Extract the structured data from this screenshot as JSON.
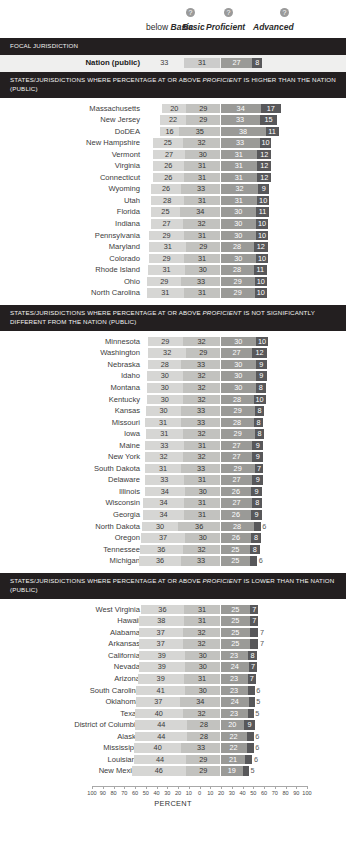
{
  "header": {
    "categories": [
      {
        "prefix": "below ",
        "label": "Basic",
        "help": false,
        "icon": "help-icon"
      },
      {
        "prefix": "",
        "label": "Basic",
        "help": true,
        "icon": "help-icon"
      },
      {
        "prefix": "",
        "label": "Proficient",
        "help": true,
        "icon": "help-icon"
      },
      {
        "prefix": "",
        "label": "Advanced",
        "help": true,
        "icon": "help-icon"
      }
    ],
    "help_glyph": "?"
  },
  "sections": [
    {
      "title": "FOCAL JURISDICTION",
      "rows": [
        {
          "name": "Nation (public)",
          "below_basic": 33,
          "basic": 31,
          "proficient": 27,
          "advanced": 8
        }
      ]
    },
    {
      "title": "STATES/JURISDICTIONS WHERE PERCENTAGE AT OR ABOVE PROFICIENT IS HIGHER THAN THE NATION (PUBLIC)",
      "title_italic_word": "PROFICIENT",
      "rows": [
        {
          "name": "Massachusetts",
          "below_basic": 20,
          "basic": 29,
          "proficient": 34,
          "advanced": 17
        },
        {
          "name": "New Jersey",
          "below_basic": 22,
          "basic": 29,
          "proficient": 33,
          "advanced": 15
        },
        {
          "name": "DoDEA",
          "below_basic": 16,
          "basic": 35,
          "proficient": 38,
          "advanced": 11
        },
        {
          "name": "New Hampshire",
          "below_basic": 25,
          "basic": 32,
          "proficient": 33,
          "advanced": 10
        },
        {
          "name": "Vermont",
          "below_basic": 27,
          "basic": 30,
          "proficient": 31,
          "advanced": 12
        },
        {
          "name": "Virginia",
          "below_basic": 26,
          "basic": 31,
          "proficient": 31,
          "advanced": 12
        },
        {
          "name": "Connecticut",
          "below_basic": 26,
          "basic": 31,
          "proficient": 31,
          "advanced": 12
        },
        {
          "name": "Wyoming",
          "below_basic": 26,
          "basic": 33,
          "proficient": 32,
          "advanced": 9
        },
        {
          "name": "Utah",
          "below_basic": 28,
          "basic": 31,
          "proficient": 31,
          "advanced": 10
        },
        {
          "name": "Florida",
          "below_basic": 25,
          "basic": 34,
          "proficient": 30,
          "advanced": 11
        },
        {
          "name": "Indiana",
          "below_basic": 27,
          "basic": 32,
          "proficient": 30,
          "advanced": 10
        },
        {
          "name": "Pennsylvania",
          "below_basic": 29,
          "basic": 31,
          "proficient": 30,
          "advanced": 10
        },
        {
          "name": "Maryland",
          "below_basic": 31,
          "basic": 29,
          "proficient": 28,
          "advanced": 12
        },
        {
          "name": "Colorado",
          "below_basic": 29,
          "basic": 31,
          "proficient": 30,
          "advanced": 10
        },
        {
          "name": "Rhode Island",
          "below_basic": 31,
          "basic": 30,
          "proficient": 28,
          "advanced": 11
        },
        {
          "name": "Ohio",
          "below_basic": 29,
          "basic": 33,
          "proficient": 29,
          "advanced": 10
        },
        {
          "name": "North Carolina",
          "below_basic": 31,
          "basic": 31,
          "proficient": 29,
          "advanced": 10
        }
      ]
    },
    {
      "title": "STATES/JURISDICTIONS WHERE PERCENTAGE AT OR ABOVE PROFICIENT IS NOT SIGNIFICANTLY DIFFERENT FROM THE NATION (PUBLIC)",
      "title_italic_word": "PROFICIENT",
      "rows": [
        {
          "name": "Minnesota",
          "below_basic": 29,
          "basic": 32,
          "proficient": 30,
          "advanced": 10
        },
        {
          "name": "Washington",
          "below_basic": 32,
          "basic": 29,
          "proficient": 27,
          "advanced": 12
        },
        {
          "name": "Nebraska",
          "below_basic": 28,
          "basic": 33,
          "proficient": 30,
          "advanced": 9
        },
        {
          "name": "Idaho",
          "below_basic": 30,
          "basic": 32,
          "proficient": 30,
          "advanced": 9
        },
        {
          "name": "Montana",
          "below_basic": 30,
          "basic": 32,
          "proficient": 30,
          "advanced": 8
        },
        {
          "name": "Kentucky",
          "below_basic": 30,
          "basic": 32,
          "proficient": 28,
          "advanced": 10
        },
        {
          "name": "Kansas",
          "below_basic": 30,
          "basic": 33,
          "proficient": 29,
          "advanced": 8
        },
        {
          "name": "Missouri",
          "below_basic": 31,
          "basic": 33,
          "proficient": 28,
          "advanced": 8
        },
        {
          "name": "Iowa",
          "below_basic": 31,
          "basic": 32,
          "proficient": 29,
          "advanced": 8
        },
        {
          "name": "Maine",
          "below_basic": 33,
          "basic": 31,
          "proficient": 27,
          "advanced": 9
        },
        {
          "name": "New York",
          "below_basic": 32,
          "basic": 32,
          "proficient": 27,
          "advanced": 9
        },
        {
          "name": "South Dakota",
          "below_basic": 31,
          "basic": 33,
          "proficient": 29,
          "advanced": 7
        },
        {
          "name": "Delaware",
          "below_basic": 33,
          "basic": 31,
          "proficient": 27,
          "advanced": 9
        },
        {
          "name": "Illinois",
          "below_basic": 34,
          "basic": 30,
          "proficient": 26,
          "advanced": 9
        },
        {
          "name": "Wisconsin",
          "below_basic": 34,
          "basic": 31,
          "proficient": 27,
          "advanced": 8
        },
        {
          "name": "Georgia",
          "below_basic": 34,
          "basic": 31,
          "proficient": 26,
          "advanced": 9
        },
        {
          "name": "North Dakota",
          "below_basic": 30,
          "basic": 36,
          "proficient": 28,
          "advanced": 6,
          "label_outside": true
        },
        {
          "name": "Oregon",
          "below_basic": 37,
          "basic": 30,
          "proficient": 26,
          "advanced": 8
        },
        {
          "name": "Tennessee",
          "below_basic": 36,
          "basic": 32,
          "proficient": 25,
          "advanced": 8
        },
        {
          "name": "Michigan",
          "below_basic": 36,
          "basic": 33,
          "proficient": 25,
          "advanced": 6,
          "label_outside": true
        }
      ]
    },
    {
      "title": "STATES/JURISDICTIONS WHERE PERCENTAGE AT OR ABOVE PROFICIENT IS LOWER THAN THE NATION (PUBLIC)",
      "title_italic_word": "PROFICIENT",
      "rows": [
        {
          "name": "West Virginia",
          "below_basic": 36,
          "basic": 31,
          "proficient": 25,
          "advanced": 7
        },
        {
          "name": "Hawaii",
          "below_basic": 38,
          "basic": 31,
          "proficient": 25,
          "advanced": 7
        },
        {
          "name": "Alabama",
          "below_basic": 37,
          "basic": 32,
          "proficient": 25,
          "advanced": 7,
          "label_outside": true
        },
        {
          "name": "Arkansas",
          "below_basic": 37,
          "basic": 32,
          "proficient": 25,
          "advanced": 7,
          "label_outside": true
        },
        {
          "name": "California",
          "below_basic": 39,
          "basic": 30,
          "proficient": 23,
          "advanced": 8
        },
        {
          "name": "Nevada",
          "below_basic": 39,
          "basic": 30,
          "proficient": 24,
          "advanced": 7
        },
        {
          "name": "Arizona",
          "below_basic": 39,
          "basic": 31,
          "proficient": 23,
          "advanced": 7
        },
        {
          "name": "South Carolina",
          "below_basic": 41,
          "basic": 30,
          "proficient": 23,
          "advanced": 6,
          "label_outside": true
        },
        {
          "name": "Oklahoma",
          "below_basic": 37,
          "basic": 34,
          "proficient": 24,
          "advanced": 5,
          "label_outside": true
        },
        {
          "name": "Texas",
          "below_basic": 40,
          "basic": 32,
          "proficient": 23,
          "advanced": 5,
          "label_outside": true
        },
        {
          "name": "District of Columbia",
          "below_basic": 44,
          "basic": 28,
          "proficient": 20,
          "advanced": 9
        },
        {
          "name": "Alaska",
          "below_basic": 44,
          "basic": 28,
          "proficient": 22,
          "advanced": 6,
          "label_outside": true
        },
        {
          "name": "Mississippi",
          "below_basic": 40,
          "basic": 33,
          "proficient": 22,
          "advanced": 6,
          "label_outside": true
        },
        {
          "name": "Louisiana",
          "below_basic": 44,
          "basic": 29,
          "proficient": 21,
          "advanced": 6,
          "label_outside": true
        },
        {
          "name": "New Mexico",
          "below_basic": 46,
          "basic": 29,
          "proficient": 19,
          "advanced": 5,
          "label_outside": true
        }
      ]
    }
  ],
  "axis": {
    "title": "PERCENT",
    "ticks": [
      100,
      90,
      80,
      70,
      60,
      50,
      40,
      30,
      20,
      10,
      0,
      10,
      20,
      30,
      40,
      50,
      60,
      70,
      80,
      90,
      100
    ]
  },
  "colors": {
    "below_basic": "#d6d6d4",
    "basic": "#c2c2bf",
    "proficient": "#9a9a97",
    "advanced": "#58585a",
    "section_bar": "#231f20",
    "focal_band": "#efefee"
  },
  "chart_data": {
    "type": "bar",
    "subtype": "stacked-horizontal-diverging",
    "xlabel": "PERCENT",
    "ylabel": "",
    "xlim": [
      -100,
      100
    ],
    "grid": false,
    "legend_position": "top",
    "zero_anchor": "boundary between Basic and Proficient",
    "categories": [
      "below Basic",
      "Basic",
      "Proficient",
      "Advanced"
    ],
    "series": [
      {
        "name": "Nation (public)",
        "group": "FOCAL JURISDICTION",
        "values": [
          33,
          31,
          27,
          8
        ]
      },
      {
        "name": "Massachusetts",
        "group": "higher",
        "values": [
          20,
          29,
          34,
          17
        ]
      },
      {
        "name": "New Jersey",
        "group": "higher",
        "values": [
          22,
          29,
          33,
          15
        ]
      },
      {
        "name": "DoDEA",
        "group": "higher",
        "values": [
          16,
          35,
          38,
          11
        ]
      },
      {
        "name": "New Hampshire",
        "group": "higher",
        "values": [
          25,
          32,
          33,
          10
        ]
      },
      {
        "name": "Vermont",
        "group": "higher",
        "values": [
          27,
          30,
          31,
          12
        ]
      },
      {
        "name": "Virginia",
        "group": "higher",
        "values": [
          26,
          31,
          31,
          12
        ]
      },
      {
        "name": "Connecticut",
        "group": "higher",
        "values": [
          26,
          31,
          31,
          12
        ]
      },
      {
        "name": "Wyoming",
        "group": "higher",
        "values": [
          26,
          33,
          32,
          9
        ]
      },
      {
        "name": "Utah",
        "group": "higher",
        "values": [
          28,
          31,
          31,
          10
        ]
      },
      {
        "name": "Florida",
        "group": "higher",
        "values": [
          25,
          34,
          30,
          11
        ]
      },
      {
        "name": "Indiana",
        "group": "higher",
        "values": [
          27,
          32,
          30,
          10
        ]
      },
      {
        "name": "Pennsylvania",
        "group": "higher",
        "values": [
          29,
          31,
          30,
          10
        ]
      },
      {
        "name": "Maryland",
        "group": "higher",
        "values": [
          31,
          29,
          28,
          12
        ]
      },
      {
        "name": "Colorado",
        "group": "higher",
        "values": [
          29,
          31,
          30,
          10
        ]
      },
      {
        "name": "Rhode Island",
        "group": "higher",
        "values": [
          31,
          30,
          28,
          11
        ]
      },
      {
        "name": "Ohio",
        "group": "higher",
        "values": [
          29,
          33,
          29,
          10
        ]
      },
      {
        "name": "North Carolina",
        "group": "higher",
        "values": [
          31,
          31,
          29,
          10
        ]
      },
      {
        "name": "Minnesota",
        "group": "not-different",
        "values": [
          29,
          32,
          30,
          10
        ]
      },
      {
        "name": "Washington",
        "group": "not-different",
        "values": [
          32,
          29,
          27,
          12
        ]
      },
      {
        "name": "Nebraska",
        "group": "not-different",
        "values": [
          28,
          33,
          30,
          9
        ]
      },
      {
        "name": "Idaho",
        "group": "not-different",
        "values": [
          30,
          32,
          30,
          9
        ]
      },
      {
        "name": "Montana",
        "group": "not-different",
        "values": [
          30,
          32,
          30,
          8
        ]
      },
      {
        "name": "Kentucky",
        "group": "not-different",
        "values": [
          30,
          32,
          28,
          10
        ]
      },
      {
        "name": "Kansas",
        "group": "not-different",
        "values": [
          30,
          33,
          29,
          8
        ]
      },
      {
        "name": "Missouri",
        "group": "not-different",
        "values": [
          31,
          33,
          28,
          8
        ]
      },
      {
        "name": "Iowa",
        "group": "not-different",
        "values": [
          31,
          32,
          29,
          8
        ]
      },
      {
        "name": "Maine",
        "group": "not-different",
        "values": [
          33,
          31,
          27,
          9
        ]
      },
      {
        "name": "New York",
        "group": "not-different",
        "values": [
          32,
          32,
          27,
          9
        ]
      },
      {
        "name": "South Dakota",
        "group": "not-different",
        "values": [
          31,
          33,
          29,
          7
        ]
      },
      {
        "name": "Delaware",
        "group": "not-different",
        "values": [
          33,
          31,
          27,
          9
        ]
      },
      {
        "name": "Illinois",
        "group": "not-different",
        "values": [
          34,
          30,
          26,
          9
        ]
      },
      {
        "name": "Wisconsin",
        "group": "not-different",
        "values": [
          34,
          31,
          27,
          8
        ]
      },
      {
        "name": "Georgia",
        "group": "not-different",
        "values": [
          34,
          31,
          26,
          9
        ]
      },
      {
        "name": "North Dakota",
        "group": "not-different",
        "values": [
          30,
          36,
          28,
          6
        ]
      },
      {
        "name": "Oregon",
        "group": "not-different",
        "values": [
          37,
          30,
          26,
          8
        ]
      },
      {
        "name": "Tennessee",
        "group": "not-different",
        "values": [
          36,
          32,
          25,
          8
        ]
      },
      {
        "name": "Michigan",
        "group": "not-different",
        "values": [
          36,
          33,
          25,
          6
        ]
      },
      {
        "name": "West Virginia",
        "group": "lower",
        "values": [
          36,
          31,
          25,
          7
        ]
      },
      {
        "name": "Hawaii",
        "group": "lower",
        "values": [
          38,
          31,
          25,
          7
        ]
      },
      {
        "name": "Alabama",
        "group": "lower",
        "values": [
          37,
          32,
          25,
          7
        ]
      },
      {
        "name": "Arkansas",
        "group": "lower",
        "values": [
          37,
          32,
          25,
          7
        ]
      },
      {
        "name": "California",
        "group": "lower",
        "values": [
          39,
          30,
          23,
          8
        ]
      },
      {
        "name": "Nevada",
        "group": "lower",
        "values": [
          39,
          30,
          24,
          7
        ]
      },
      {
        "name": "Arizona",
        "group": "lower",
        "values": [
          39,
          31,
          23,
          7
        ]
      },
      {
        "name": "South Carolina",
        "group": "lower",
        "values": [
          41,
          30,
          23,
          6
        ]
      },
      {
        "name": "Oklahoma",
        "group": "lower",
        "values": [
          37,
          34,
          24,
          5
        ]
      },
      {
        "name": "Texas",
        "group": "lower",
        "values": [
          40,
          32,
          23,
          5
        ]
      },
      {
        "name": "District of Columbia",
        "group": "lower",
        "values": [
          44,
          28,
          20,
          9
        ]
      },
      {
        "name": "Alaska",
        "group": "lower",
        "values": [
          44,
          28,
          22,
          6
        ]
      },
      {
        "name": "Mississippi",
        "group": "lower",
        "values": [
          40,
          33,
          22,
          6
        ]
      },
      {
        "name": "Louisiana",
        "group": "lower",
        "values": [
          44,
          29,
          21,
          6
        ]
      },
      {
        "name": "New Mexico",
        "group": "lower",
        "values": [
          46,
          29,
          19,
          5
        ]
      }
    ]
  }
}
